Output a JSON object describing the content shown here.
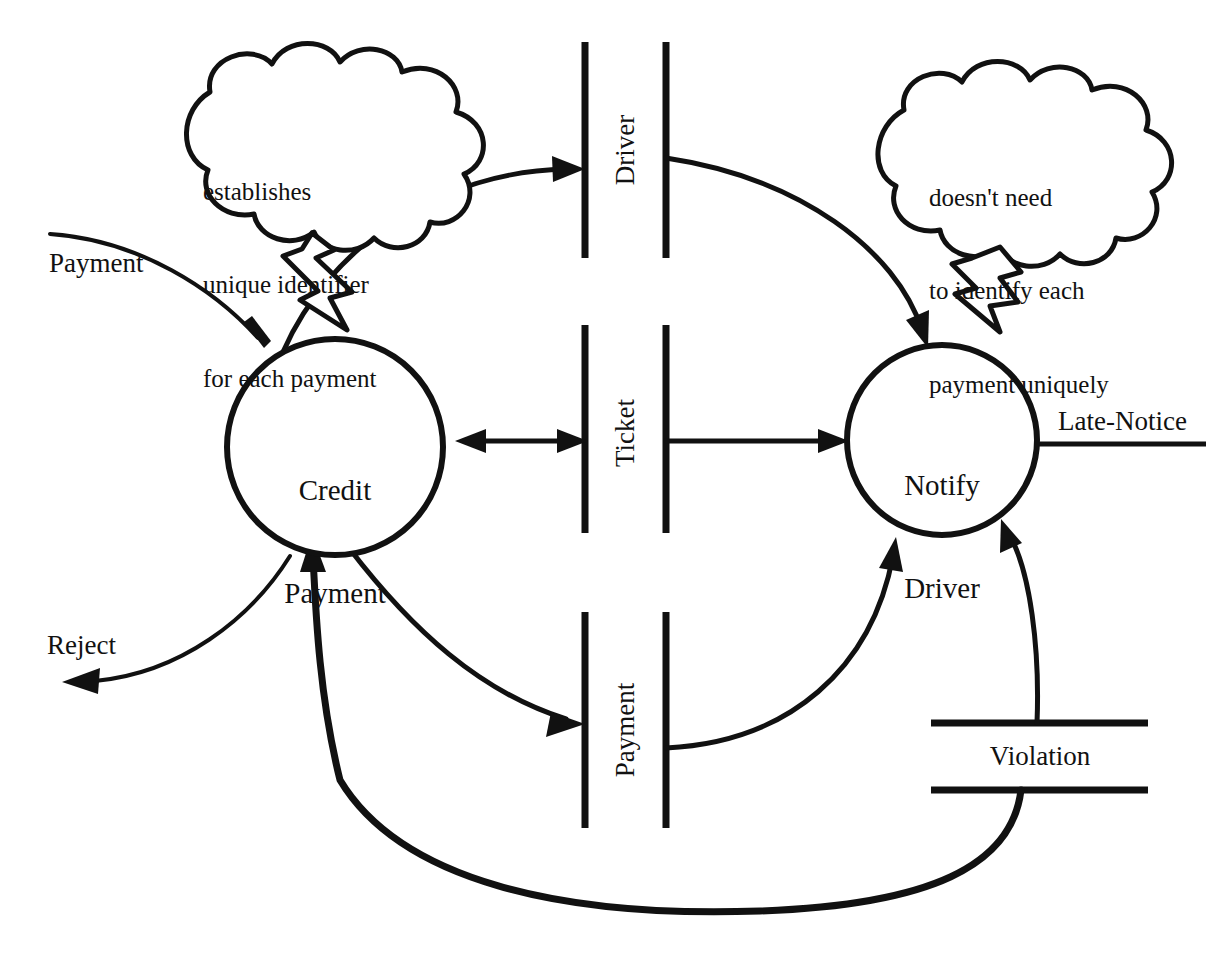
{
  "diagram": {
    "type": "data-flow-diagram",
    "title": "",
    "processes": [
      {
        "id": "credit-payment",
        "label_line1": "Credit",
        "label_line2": "Payment"
      },
      {
        "id": "notify-driver",
        "label_line1": "Notify",
        "label_line2": "Driver"
      }
    ],
    "data_stores": [
      {
        "id": "driver",
        "label": "Driver",
        "orientation": "vertical"
      },
      {
        "id": "ticket",
        "label": "Ticket",
        "orientation": "vertical"
      },
      {
        "id": "payment",
        "label": "Payment",
        "orientation": "vertical"
      },
      {
        "id": "violation",
        "label": "Violation",
        "orientation": "horizontal"
      }
    ],
    "flows": [
      {
        "id": "payment-in",
        "label": "Payment",
        "from": "external",
        "to": "credit-payment"
      },
      {
        "id": "reject-out",
        "label": "Reject",
        "from": "credit-payment",
        "to": "external"
      },
      {
        "id": "late-notice-out",
        "label": "Late-Notice",
        "from": "notify-driver",
        "to": "external"
      },
      {
        "id": "credit-to-driver",
        "label": "",
        "from": "credit-payment",
        "to": "driver"
      },
      {
        "id": "driver-to-notify",
        "label": "",
        "from": "driver",
        "to": "notify-driver"
      },
      {
        "id": "credit-ticket",
        "label": "",
        "from": "credit-payment",
        "to": "ticket"
      },
      {
        "id": "ticket-to-notify",
        "label": "",
        "from": "ticket",
        "to": "notify-driver"
      },
      {
        "id": "credit-to-payment",
        "label": "",
        "from": "credit-payment",
        "to": "payment"
      },
      {
        "id": "payment-to-notify",
        "label": "",
        "from": "payment",
        "to": "notify-driver"
      },
      {
        "id": "violation-to-notify",
        "label": "",
        "from": "violation",
        "to": "notify-driver"
      },
      {
        "id": "violation-to-credit",
        "label": "",
        "from": "violation",
        "to": "credit-payment"
      }
    ],
    "callouts": [
      {
        "id": "left-callout",
        "lines": [
          "establishes",
          "unique identifier",
          "for each payment"
        ],
        "points_to": "credit-payment"
      },
      {
        "id": "right-callout",
        "lines": [
          "doesn't need",
          "to identify each",
          "payment uniquely"
        ],
        "points_to": "notify-driver"
      }
    ],
    "colors": {
      "ink": "#111111",
      "background": "#ffffff"
    }
  }
}
